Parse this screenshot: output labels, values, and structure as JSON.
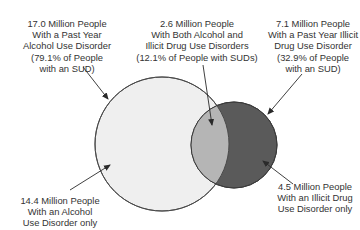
{
  "diagram": {
    "type": "venn",
    "sets": [
      {
        "id": "alcohol",
        "fill": "#efefef",
        "stroke": "#4a4a4a"
      },
      {
        "id": "illicit_drug",
        "fill": "#5a5a5a",
        "stroke": "#3a3a3a"
      }
    ],
    "intersection_fill": "#b5b5b5",
    "labels": {
      "alcohol_total": {
        "lines": [
          "17.0 Million People",
          "With a Past Year",
          "Alcohol Use Disorder",
          "(79.1% of People",
          "with an SUD)"
        ]
      },
      "both": {
        "lines": [
          "2.6 Million People",
          "With Both Alcohol and",
          "Illicit Drug Use Disorders",
          "(12.1% of People with SUDs)"
        ]
      },
      "drug_total": {
        "lines": [
          "7.1 Million People",
          "With a Past Year Illicit",
          "Drug Use Disorder",
          "(32.9% of People",
          "with an SUD)"
        ]
      },
      "alcohol_only": {
        "lines": [
          "14.4 Million People",
          "With an Alcohol",
          "Use Disorder only"
        ]
      },
      "drug_only": {
        "lines": [
          "4.5 Million People",
          "With an Illicit Drug",
          "Use Disorder only"
        ]
      }
    }
  }
}
